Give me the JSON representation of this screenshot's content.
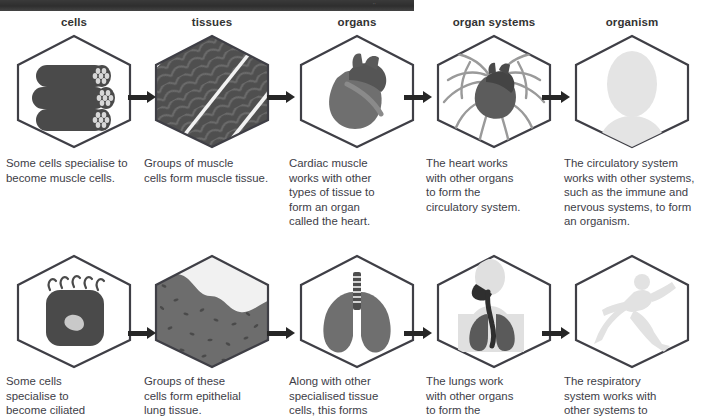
{
  "topbar": {
    "faint_text": "''"
  },
  "stages": [
    {
      "label": "cells"
    },
    {
      "label": "tissues"
    },
    {
      "label": "organs"
    },
    {
      "label": "organ systems"
    },
    {
      "label": "organism"
    }
  ],
  "rows": [
    {
      "name": "circulatory-system-row",
      "captions": [
        "Some cells specialise to\nbecome muscle cells.",
        "Groups of muscle\ncells form muscle tissue.",
        "Cardiac muscle\nworks with other\ntypes of tissue to\nform an organ\ncalled the heart.",
        "The heart works\nwith other organs\nto form the\ncirculatory system.",
        "The circulatory system\nworks with other systems,\nsuch as the immune and\nnervous systems, to form\nan organism."
      ],
      "icons": [
        "muscle-cells-icon",
        "muscle-tissue-icon",
        "heart-icon",
        "heart-vessels-icon",
        "human-bust-silhouette-icon"
      ]
    },
    {
      "name": "respiratory-system-row",
      "captions": [
        "Some cells\nspecialise to\nbecome ciliated",
        "Groups of these\ncells form epithelial\nlung tissue.",
        "Along with other\nspecialised tissue\ncells, this forms",
        "The lungs work\nwith other organs\nto form the",
        "The respiratory\nsystem works with\nother systems to"
      ],
      "icons": [
        "ciliated-cell-icon",
        "epithelial-tissue-icon",
        "lungs-icon",
        "lungs-in-torso-icon",
        "running-person-silhouette-icon"
      ]
    }
  ],
  "arrows": {
    "name": "flow-arrow",
    "count_per_row": 4
  },
  "colors": {
    "hex_outline": "#3f3f46",
    "dark_fill": "#4d4d4d",
    "mid_fill": "#6f6f6f",
    "light_silhouette": "#e3e3e3",
    "text": "#3d3d47",
    "topbar": "#2e2e2e"
  }
}
